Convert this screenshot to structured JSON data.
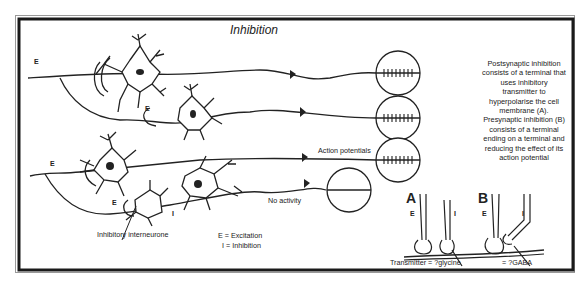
{
  "title": "Inhibition",
  "description": [
    "Postsynaptic inhibition",
    "consists of a terminal that",
    "uses inhibitory",
    "transmitter to",
    "hyperpolarise the cell",
    "membrane (A).",
    "Presynaptic inhibition (B)",
    "consists of a terminal",
    "ending on a terminal and",
    "reducing the effect of its",
    "action potential"
  ],
  "labels": {
    "action_potentials": "Action potentials",
    "no_activity": "No activity",
    "inhibitory_interneurone": "Inhibitory interneurone",
    "legend_e": "E =  Excitation",
    "legend_i": "I = Inhibition",
    "transmitter_glycine": "Transmitter = ?glycine",
    "gaba": "= ?GABA",
    "panel_a": "A",
    "panel_b": "B",
    "e": "E",
    "i": "I"
  },
  "colors": {
    "ink": "#222222",
    "border": "#1a1a1a",
    "background": "#ffffff"
  }
}
